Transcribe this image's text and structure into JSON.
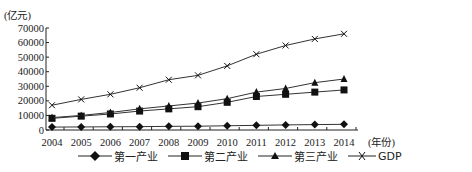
{
  "chart_data": {
    "type": "line",
    "title": "",
    "ylabel": "(亿元)",
    "xlabel": "(年份)",
    "ylim": [
      0,
      70000
    ],
    "yticks": [
      0,
      10000,
      20000,
      30000,
      40000,
      50000,
      60000,
      70000
    ],
    "x": [
      "2004",
      "2005",
      "2006",
      "2007",
      "2008",
      "2009",
      "2010",
      "2011",
      "2012",
      "2013",
      "2014"
    ],
    "legend_position": "bottom",
    "grid": false,
    "series": [
      {
        "name": "第一产业",
        "marker": "diamond",
        "values": [
          2000,
          2100,
          2200,
          2300,
          2500,
          2600,
          2900,
          3200,
          3500,
          3700,
          3900
        ]
      },
      {
        "name": "第二产业",
        "marker": "square",
        "values": [
          8000,
          9500,
          11000,
          13000,
          14500,
          16000,
          19000,
          23000,
          24500,
          26000,
          27500
        ]
      },
      {
        "name": "第三产业",
        "marker": "triangle",
        "values": [
          8500,
          10000,
          12000,
          14500,
          16500,
          18500,
          21500,
          26000,
          28500,
          32500,
          35000
        ]
      },
      {
        "name": "GDP",
        "marker": "x",
        "values": [
          17000,
          21000,
          24500,
          29000,
          34500,
          37500,
          44000,
          52000,
          58000,
          62500,
          66000
        ]
      }
    ]
  },
  "axis": {
    "y_unit": "(亿元)",
    "x_unit": "(年份)"
  },
  "legend": [
    {
      "label": "第一产业",
      "marker": "diamond-icon"
    },
    {
      "label": "第二产业",
      "marker": "square-icon"
    },
    {
      "label": "第三产业",
      "marker": "triangle-icon"
    },
    {
      "label": "GDP",
      "marker": "x-icon"
    }
  ]
}
